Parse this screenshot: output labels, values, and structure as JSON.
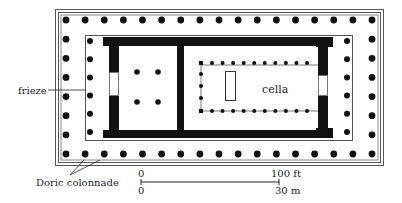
{
  "diagram": {
    "type": "architectural-floor-plan",
    "colors": {
      "ink": "#111111",
      "line": "#555555",
      "background": "#ffffff"
    }
  },
  "labels": {
    "frieze": "frieze",
    "cella": "cella",
    "doric_colonnade": "Doric colonnade"
  },
  "scale_bar": {
    "top_start": "0",
    "top_end": "100 ft",
    "bottom_start": "0",
    "bottom_end": "30 m"
  },
  "colonnade": {
    "outer_columns_long_side": 17,
    "outer_columns_short_side": 8,
    "prostyle_columns_each_end": 6,
    "inner_cella_columns_long_side": 10,
    "back_room_columns": 4
  }
}
